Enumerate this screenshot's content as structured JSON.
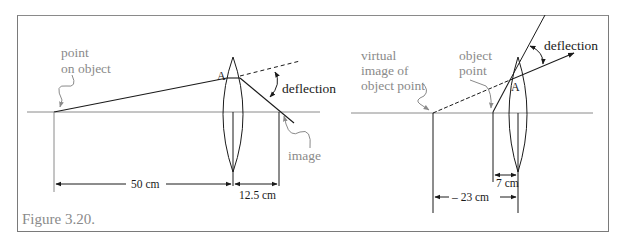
{
  "figure": {
    "caption": "Figure 3.20.",
    "colors": {
      "ink": "#1a1a1a",
      "annotation": "#8a8a8a",
      "frame": "#7a7a7a"
    }
  },
  "left_diagram": {
    "title": "Converging lens, real image",
    "labels": {
      "object_point": [
        "point",
        "on object"
      ],
      "lens_point": "A",
      "deflection": "deflection",
      "image": "image"
    },
    "dimensions": {
      "object_distance": "50 cm",
      "image_distance": "12.5 cm"
    }
  },
  "right_diagram": {
    "title": "Converging lens, virtual image",
    "labels": {
      "virtual_image": [
        "virtual",
        "image of",
        "object point"
      ],
      "object_point": [
        "object",
        "point"
      ],
      "lens_point": "A",
      "deflection": "deflection"
    },
    "dimensions": {
      "object_distance": "7 cm",
      "image_distance": "– 23 cm"
    }
  }
}
